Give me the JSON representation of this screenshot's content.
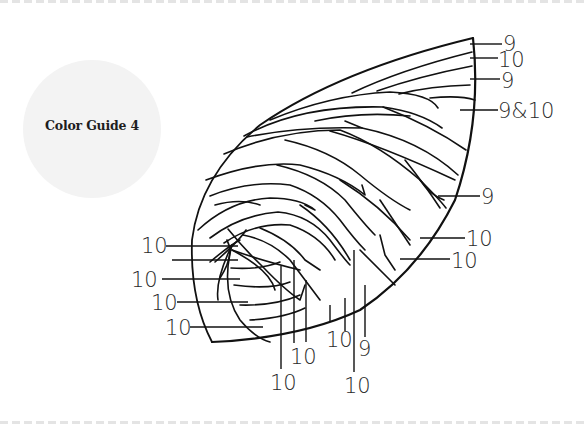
{
  "guide": {
    "title": "Color Guide 4"
  },
  "diagram": {
    "stroke_color": "#111111",
    "labels": {
      "right_top_1": "9",
      "right_top_2": "10",
      "right_top_3": "9",
      "right_top_4": "9&10",
      "right_mid": "9",
      "right_low_1": "10",
      "right_low_2": "10",
      "left_1": "10",
      "left_2": "10",
      "left_3": "10",
      "left_4": "10",
      "bottom_1": "10",
      "bottom_2": "10",
      "bottom_3": "10",
      "bottom_4": "9",
      "bottom_5": "10"
    }
  }
}
